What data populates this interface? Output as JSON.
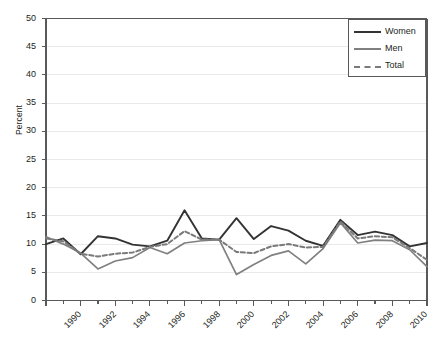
{
  "chart_data": {
    "type": "line",
    "title": "",
    "xlabel": "",
    "ylabel": "Percent",
    "ylim": [
      0,
      50
    ],
    "ytick_step": 5,
    "yticks": [
      0,
      5,
      10,
      15,
      20,
      25,
      30,
      35,
      40,
      45,
      50
    ],
    "xlim": [
      1990,
      2012
    ],
    "x": [
      1990,
      1991,
      1992,
      1993,
      1994,
      1995,
      1996,
      1997,
      1998,
      1999,
      2000,
      2001,
      2002,
      2003,
      2004,
      2005,
      2006,
      2007,
      2008,
      2009,
      2010,
      2011,
      2012
    ],
    "xticks_labeled": [
      1990,
      1992,
      1994,
      1996,
      1998,
      2000,
      2002,
      2004,
      2006,
      2008,
      2010,
      2012
    ],
    "xtick_labels": [
      "1990",
      "1992",
      "1994",
      "1996",
      "1998",
      "2000",
      "2002",
      "2004",
      "2006",
      "2008",
      "2010",
      "2012"
    ],
    "grid": true,
    "legend_position": "top-right",
    "series": [
      {
        "name": "Women",
        "style": "solid",
        "color": "#333333",
        "values": [
          10.0,
          11.0,
          8.2,
          11.4,
          11.0,
          9.9,
          9.6,
          10.6,
          16.0,
          11.0,
          10.8,
          14.6,
          10.9,
          13.2,
          12.4,
          10.6,
          9.7,
          14.3,
          11.6,
          12.2,
          11.6,
          9.6,
          10.2
        ]
      },
      {
        "name": "Men",
        "style": "solid",
        "color": "#808080",
        "values": [
          11.3,
          10.0,
          8.4,
          5.6,
          7.0,
          7.6,
          9.4,
          8.3,
          10.2,
          10.6,
          10.8,
          4.6,
          6.4,
          8.0,
          8.8,
          6.5,
          9.2,
          13.8,
          10.2,
          10.7,
          10.6,
          9.0,
          6.0
        ]
      },
      {
        "name": "Total",
        "style": "dashed",
        "color": "#7a7a7a",
        "values": [
          11.0,
          10.5,
          8.3,
          7.8,
          8.3,
          8.5,
          9.5,
          10.0,
          12.3,
          10.8,
          10.8,
          8.6,
          8.4,
          9.6,
          10.0,
          9.4,
          9.5,
          14.0,
          11.0,
          11.4,
          11.2,
          9.3,
          7.2
        ]
      }
    ]
  },
  "legend": {
    "items": [
      {
        "label": "Women"
      },
      {
        "label": "Men"
      },
      {
        "label": "Total"
      }
    ]
  },
  "colors": {
    "women": "#333333",
    "men": "#808080",
    "total": "#7a7a7a",
    "grid": "#e9e9e9",
    "axis": "#58595b",
    "text": "#231f20",
    "background": "#ffffff"
  }
}
